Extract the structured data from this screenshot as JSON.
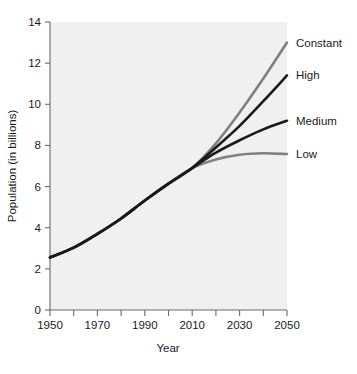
{
  "chart_data": {
    "type": "line",
    "title": "",
    "xlabel": "Year",
    "ylabel": "Population (in billions)",
    "xlim": [
      1950,
      2050
    ],
    "ylim": [
      0,
      14
    ],
    "xticks": [
      1950,
      1960,
      1970,
      1980,
      1990,
      2000,
      2010,
      2020,
      2030,
      2040,
      2050
    ],
    "xtick_labels": [
      "1950",
      "",
      "1970",
      "",
      "1990",
      "",
      "2010",
      "",
      "2030",
      "",
      "2050"
    ],
    "yticks": [
      0,
      2,
      4,
      6,
      8,
      10,
      12,
      14
    ],
    "ytick_labels": [
      "0",
      "2",
      "4",
      "6",
      "8",
      "10",
      "12",
      "14"
    ],
    "grid": false,
    "legend_position": "right-inline-labels",
    "x": [
      1950,
      1960,
      1970,
      1980,
      1990,
      2000,
      2010,
      2020,
      2030,
      2040,
      2050
    ],
    "series": [
      {
        "name": "Constant",
        "label": "Constant",
        "color": "#808080",
        "values": [
          2.55,
          3.03,
          3.7,
          4.45,
          5.32,
          6.14,
          6.9,
          8.1,
          9.6,
          11.25,
          13.0
        ]
      },
      {
        "name": "High",
        "label": "High",
        "color": "#1a1a1a",
        "values": [
          2.55,
          3.03,
          3.7,
          4.45,
          5.32,
          6.14,
          6.9,
          7.9,
          8.95,
          10.15,
          11.4
        ]
      },
      {
        "name": "Medium",
        "label": "Medium",
        "color": "#1a1a1a",
        "values": [
          2.55,
          3.03,
          3.7,
          4.45,
          5.32,
          6.14,
          6.9,
          7.65,
          8.25,
          8.78,
          9.2
        ]
      },
      {
        "name": "Low",
        "label": "Low",
        "color": "#808080",
        "values": [
          2.55,
          3.03,
          3.7,
          4.45,
          5.32,
          6.14,
          6.9,
          7.32,
          7.55,
          7.62,
          7.58
        ]
      }
    ],
    "series_end_labels": [
      {
        "text": "Constant",
        "value": 13.0
      },
      {
        "text": "High",
        "value": 11.4
      },
      {
        "text": "Medium",
        "value": 9.2
      },
      {
        "text": "Low",
        "value": 7.58
      }
    ],
    "colors": {
      "plot_background": "#f0f0f0",
      "axis": "#6b6b6b",
      "text": "#1a1a1a",
      "gray_series": "#808080",
      "black_series": "#1a1a1a"
    }
  }
}
